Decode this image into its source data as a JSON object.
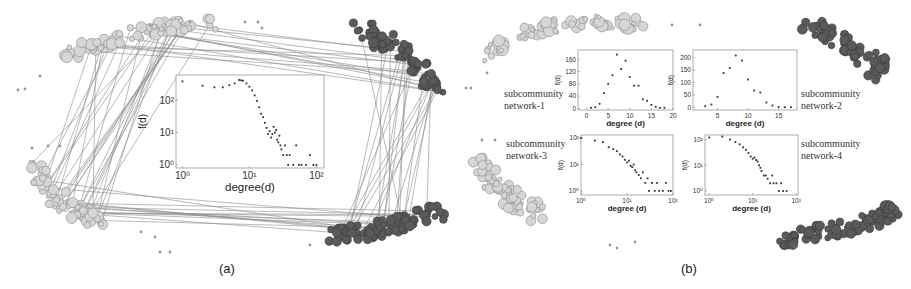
{
  "figure": {
    "panel_a_label": "(a)",
    "panel_b_label": "(b)"
  },
  "colors": {
    "light_node": "#d6d6d6",
    "light_node_stroke": "#8a8a8a",
    "dark_node": "#5a5a5a",
    "dark_node_stroke": "#3a3a3a",
    "edge": "#8c8c8c",
    "axis": "#888888",
    "marker": "#333333"
  },
  "subcommunity_labels": [
    "subcommunity\nnetwork-1",
    "subcommunity\nnetwork-2",
    "subcommunity\nnetwork-3",
    "subcommunity\nnetwork-4"
  ],
  "chart_data": [
    {
      "id": "a-main",
      "panel": "(a)",
      "type": "scatter",
      "title": "",
      "xlabel": "degree(d)",
      "ylabel": "f(d)",
      "xscale": "log",
      "yscale": "log",
      "xlim": [
        0.8,
        130
      ],
      "ylim": [
        0.8,
        600
      ],
      "xticks": [
        "10^0",
        "10^1",
        "10^2"
      ],
      "yticks": [
        "10^0",
        "10^1",
        "10^2"
      ],
      "grid": false,
      "legend": null,
      "x": [
        1,
        2,
        3,
        4,
        5,
        6,
        7,
        7.5,
        8,
        9,
        10,
        11,
        12,
        13,
        14,
        15,
        16,
        17,
        18,
        19,
        20,
        21,
        22,
        23,
        24,
        25,
        26,
        27,
        28,
        29,
        30,
        32,
        34,
        36,
        38,
        40,
        45,
        50,
        55,
        60,
        70,
        80,
        90,
        100
      ],
      "y": [
        380,
        280,
        250,
        250,
        290,
        330,
        420,
        410,
        400,
        330,
        260,
        200,
        140,
        95,
        60,
        38,
        30,
        20,
        14,
        9,
        11,
        7,
        9,
        15,
        10,
        12,
        6,
        5,
        8,
        4,
        3,
        2,
        4,
        2,
        1,
        2,
        1,
        4,
        1,
        1,
        1,
        2,
        1,
        1
      ]
    },
    {
      "id": "b-1",
      "panel": "(b)",
      "label": "subcommunity network-1",
      "type": "scatter",
      "xlabel": "degree (d)",
      "ylabel": "f(d)",
      "xscale": "linear",
      "yscale": "linear",
      "xlim": [
        -2,
        20
      ],
      "ylim": [
        -5,
        190
      ],
      "xticks": [
        0,
        5,
        10,
        15,
        20
      ],
      "yticks": [
        0,
        40,
        80,
        120,
        160
      ],
      "grid": false,
      "x": [
        1,
        2,
        3,
        4,
        5,
        6,
        7,
        8,
        9,
        10,
        11,
        12,
        13,
        14,
        15,
        16,
        17,
        18
      ],
      "y": [
        2,
        4,
        15,
        50,
        80,
        108,
        175,
        128,
        155,
        102,
        74,
        74,
        30,
        25,
        12,
        5,
        2,
        2
      ]
    },
    {
      "id": "b-2",
      "panel": "(b)",
      "label": "subcommunity network-2",
      "type": "scatter",
      "xlabel": "degree (d)",
      "ylabel": "f(d)",
      "xscale": "linear",
      "yscale": "linear",
      "xlim": [
        1,
        18
      ],
      "ylim": [
        -10,
        230
      ],
      "xticks": [
        5,
        10,
        15
      ],
      "yticks": [
        0,
        50,
        100,
        150,
        200
      ],
      "grid": false,
      "x": [
        3,
        4,
        5,
        6,
        7,
        8,
        9,
        10,
        11,
        12,
        13,
        14,
        15,
        16,
        17
      ],
      "y": [
        5,
        12,
        42,
        138,
        158,
        208,
        188,
        112,
        68,
        60,
        20,
        8,
        2,
        1,
        1
      ]
    },
    {
      "id": "b-3",
      "panel": "(b)",
      "label": "subcommunity network-3",
      "type": "scatter",
      "xlabel": "degree (d)",
      "ylabel": "f(d)",
      "xscale": "log",
      "yscale": "log",
      "xlim": [
        1,
        100
      ],
      "ylim": [
        0.7,
        130
      ],
      "xticks": [
        "10^0",
        "10^1",
        "10^2"
      ],
      "yticks": [
        "10^0",
        "10^1",
        "10^2"
      ],
      "grid": false,
      "x": [
        1,
        2,
        3,
        4,
        5,
        6,
        7,
        8,
        9,
        10,
        11,
        12,
        13,
        14,
        15,
        16,
        18,
        20,
        22,
        25,
        28,
        30,
        35,
        40,
        45,
        50,
        60,
        70,
        80,
        90
      ],
      "y": [
        100,
        80,
        70,
        45,
        38,
        32,
        24,
        20,
        15,
        12,
        14,
        9,
        8,
        10,
        6,
        5,
        4,
        3,
        5,
        2,
        3,
        1,
        2,
        1,
        2,
        1,
        1,
        2,
        1,
        1
      ]
    },
    {
      "id": "b-4",
      "panel": "(b)",
      "label": "subcommunity network-4",
      "type": "scatter",
      "xlabel": "degree (d)",
      "ylabel": "f(d)",
      "xscale": "log",
      "yscale": "log",
      "xlim": [
        0.8,
        110
      ],
      "ylim": [
        0.7,
        150
      ],
      "xticks": [
        "10^0",
        "10^1",
        "10^2"
      ],
      "yticks": [
        "10^0",
        "10^1",
        "10^2"
      ],
      "grid": false,
      "x": [
        1,
        2,
        3,
        4,
        5,
        6,
        7,
        8,
        9,
        10,
        11,
        12,
        13,
        14,
        15,
        16,
        18,
        20,
        22,
        25,
        28,
        30,
        35,
        40,
        45,
        50,
        60
      ],
      "y": [
        120,
        130,
        100,
        80,
        65,
        50,
        40,
        30,
        22,
        18,
        20,
        16,
        14,
        10,
        8,
        6,
        4,
        4,
        3,
        2,
        4,
        2,
        2,
        1,
        2,
        1,
        1
      ]
    }
  ]
}
